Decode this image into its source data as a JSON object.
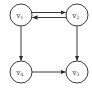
{
  "graph": {
    "type": "directed",
    "nodes": [
      {
        "id": "v1",
        "base": "v",
        "sub": "1",
        "cx": 21,
        "cy": 15
      },
      {
        "id": "v2",
        "base": "v",
        "sub": "2",
        "cx": 77,
        "cy": 15
      },
      {
        "id": "v4",
        "base": "v",
        "sub": "4",
        "cx": 21,
        "cy": 72
      },
      {
        "id": "v3",
        "base": "v",
        "sub": "3",
        "cx": 77,
        "cy": 72
      }
    ],
    "edges": [
      {
        "from": "v1",
        "to": "v2"
      },
      {
        "from": "v2",
        "to": "v1"
      },
      {
        "from": "v1",
        "to": "v4"
      },
      {
        "from": "v2",
        "to": "v3"
      },
      {
        "from": "v4",
        "to": "v3"
      }
    ],
    "colors": {
      "stroke": "#3a3a3a",
      "fill": "#ffffff",
      "text": "#2a2a2a"
    }
  }
}
